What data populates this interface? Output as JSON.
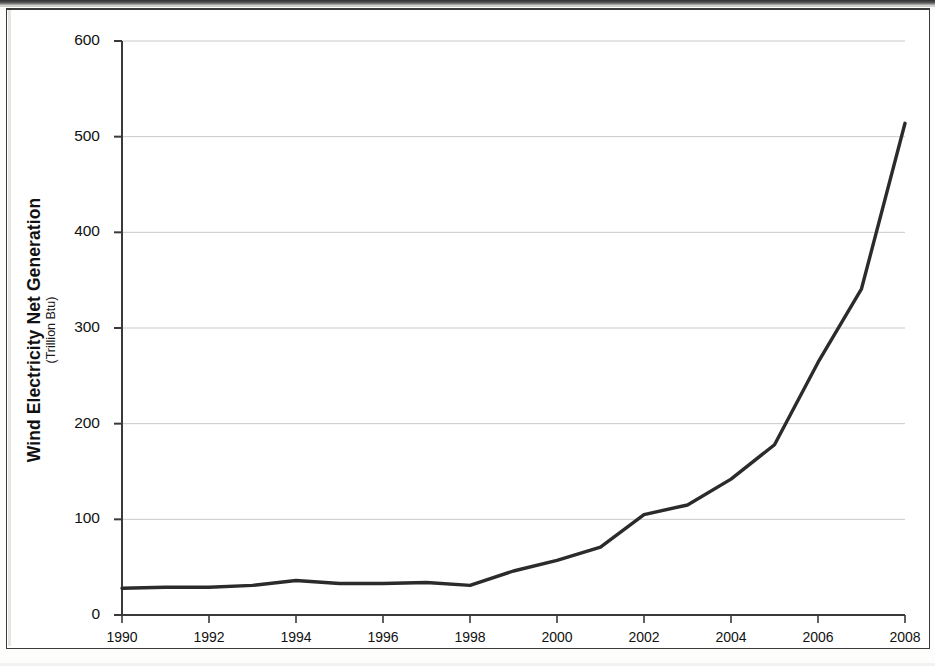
{
  "figure": {
    "background_color": "#ffffff",
    "frame_color": "#3b3b3b",
    "gridline_color": "#c9c9c9",
    "axis_color": "#3a3a3a",
    "series_color": "#2b2b2b"
  },
  "chart_data": {
    "type": "line",
    "title": "",
    "xlabel": "",
    "ylabel": "Wind Electricity Net Generation",
    "ylabel_units": "(Trillion Btu)",
    "xlim": [
      1990,
      2008
    ],
    "ylim": [
      0,
      600
    ],
    "ytick_step": 100,
    "xtick_step": 2,
    "grid": true,
    "grid_axis": "y",
    "legend": false,
    "ytick_labels": [
      "0",
      "100",
      "200",
      "300",
      "400",
      "500",
      "600"
    ],
    "ytick_values": [
      0,
      100,
      200,
      300,
      400,
      500,
      600
    ],
    "xtick_labels": [
      "1990",
      "1992",
      "1994",
      "1996",
      "1998",
      "2000",
      "2002",
      "2004",
      "2006",
      "2008"
    ],
    "xtick_values": [
      1990,
      1992,
      1994,
      1996,
      1998,
      2000,
      2002,
      2004,
      2006,
      2008
    ],
    "x": [
      1990,
      1991,
      1992,
      1993,
      1994,
      1995,
      1996,
      1997,
      1998,
      1999,
      2000,
      2001,
      2002,
      2003,
      2004,
      2005,
      2006,
      2007,
      2008
    ],
    "values": [
      28,
      29,
      29,
      31,
      36,
      33,
      33,
      34,
      31,
      46,
      57,
      71,
      105,
      115,
      142,
      178,
      264,
      341,
      514
    ],
    "series": [
      {
        "name": "Wind Electricity Net Generation",
        "values": [
          28,
          29,
          29,
          31,
          36,
          33,
          33,
          34,
          31,
          46,
          57,
          71,
          105,
          115,
          142,
          178,
          264,
          341,
          514
        ]
      }
    ]
  }
}
